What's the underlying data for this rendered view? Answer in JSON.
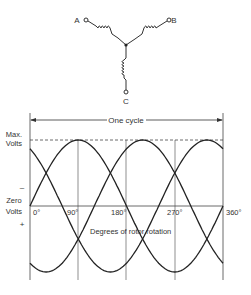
{
  "wye": {
    "center": [
      126,
      45
    ],
    "terminals": [
      {
        "label": "A",
        "pos": [
          86,
          20
        ],
        "label_pos": [
          77,
          23
        ]
      },
      {
        "label": "B",
        "pos": [
          169,
          20
        ],
        "label_pos": [
          173,
          23
        ]
      },
      {
        "label": "C",
        "pos": [
          126,
          93
        ],
        "label_pos": [
          126,
          104
        ]
      }
    ]
  },
  "graph": {
    "cycle_label": "One cycle",
    "max_label_1": "Max.",
    "max_label_2": "Volts",
    "zero_label_1": "Zero",
    "zero_label_2": "Volts",
    "minus_sign": "–",
    "plus_sign": "+",
    "x_axis_label": "Degrees of rotor rotation",
    "tick_labels": [
      "0°",
      "90°",
      "180°",
      "270°",
      "360°"
    ]
  },
  "chart_data": {
    "type": "line",
    "xlabel": "Degrees of rotor rotation",
    "ylabel": "Volts",
    "x_ticks": [
      0,
      90,
      180,
      270,
      360
    ],
    "xlim": [
      0,
      360
    ],
    "ylim": [
      -1,
      1
    ],
    "y_tick_labels": [
      "Max. Volts",
      "–",
      "Zero Volts",
      "+"
    ],
    "series": [
      {
        "name": "Phase A",
        "phase_deg": 0,
        "peak_at_deg": 90
      },
      {
        "name": "Phase B",
        "phase_deg": -120,
        "peak_at_deg": 210
      },
      {
        "name": "Phase C",
        "phase_deg": 120,
        "peak_at_deg": 330
      }
    ],
    "annotations": [
      "One cycle (0° to 360°)",
      "Max. Volts dashed line"
    ]
  }
}
